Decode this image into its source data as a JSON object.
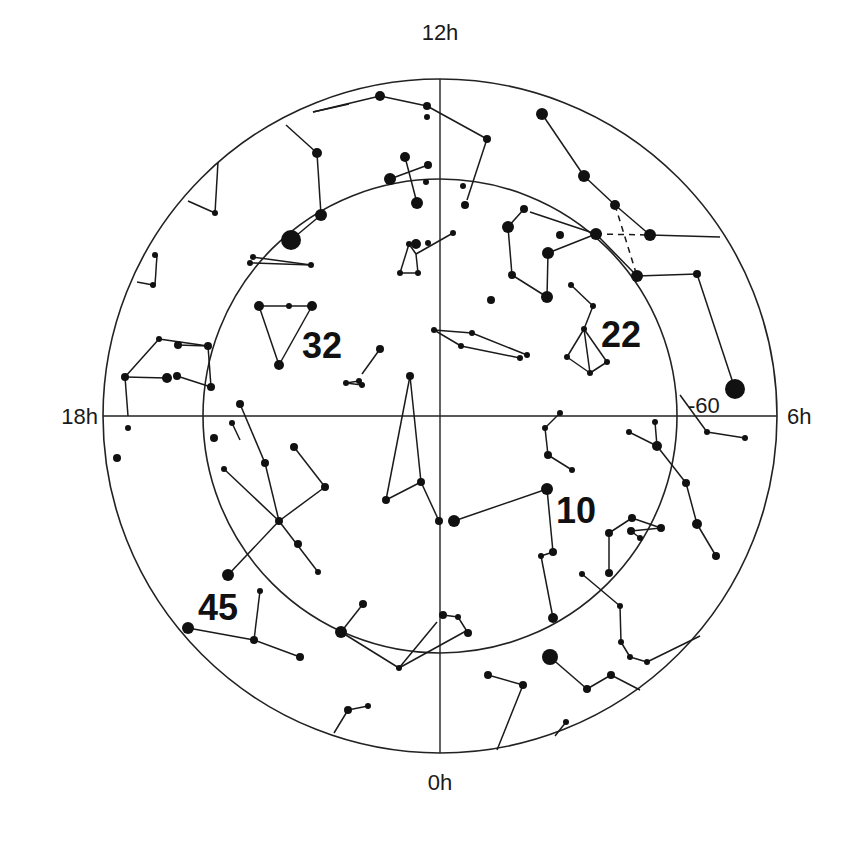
{
  "chart": {
    "title": "",
    "projection": "south polar sky chart",
    "center": [
      440,
      416
    ],
    "outer_radius": 337,
    "inner_radius": 237,
    "colors": {
      "ink": "#111111",
      "background": "#ffffff"
    }
  },
  "labels": {
    "hour_12": "12h",
    "hour_18": "18h",
    "hour_6": "6h",
    "hour_0": "0h",
    "declination": "-60",
    "field_32": "32",
    "field_22": "22",
    "field_10": "10",
    "field_45": "45"
  },
  "stars": [
    [
      380,
      96,
      5
    ],
    [
      427,
      106,
      4
    ],
    [
      427,
      117,
      3
    ],
    [
      487,
      139,
      4
    ],
    [
      317,
      153,
      5
    ],
    [
      405,
      157,
      5
    ],
    [
      428,
      165,
      4
    ],
    [
      390,
      179,
      6
    ],
    [
      426,
      182,
      3
    ],
    [
      417,
      203,
      6
    ],
    [
      463,
      186,
      3
    ],
    [
      465,
      205,
      4
    ],
    [
      321,
      215,
      6
    ],
    [
      291,
      240,
      10
    ],
    [
      215,
      213,
      3
    ],
    [
      155,
      255,
      3
    ],
    [
      153,
      285,
      3
    ],
    [
      253,
      257,
      3
    ],
    [
      250,
      263,
      3
    ],
    [
      311,
      265,
      3
    ],
    [
      259,
      306,
      5
    ],
    [
      289,
      306,
      3
    ],
    [
      312,
      306,
      5
    ],
    [
      279,
      365,
      5
    ],
    [
      416,
      244,
      5
    ],
    [
      409,
      244,
      3
    ],
    [
      428,
      243,
      3
    ],
    [
      453,
      233,
      3
    ],
    [
      400,
      273,
      3
    ],
    [
      418,
      273,
      3
    ],
    [
      542,
      114,
      6
    ],
    [
      584,
      176,
      6
    ],
    [
      615,
      205,
      5
    ],
    [
      596,
      234,
      6
    ],
    [
      650,
      235,
      6
    ],
    [
      637,
      276,
      6
    ],
    [
      697,
      274,
      4
    ],
    [
      735,
      389,
      10
    ],
    [
      524,
      209,
      4
    ],
    [
      508,
      227,
      6
    ],
    [
      512,
      275,
      4
    ],
    [
      547,
      297,
      6
    ],
    [
      548,
      253,
      6
    ],
    [
      560,
      235,
      4
    ],
    [
      491,
      300,
      4
    ],
    [
      571,
      285,
      3
    ],
    [
      593,
      306,
      3
    ],
    [
      584,
      329,
      3
    ],
    [
      567,
      357,
      3
    ],
    [
      590,
      373,
      3
    ],
    [
      607,
      362,
      3
    ],
    [
      434,
      330,
      3
    ],
    [
      472,
      333,
      3
    ],
    [
      461,
      346,
      3
    ],
    [
      520,
      358,
      3
    ],
    [
      527,
      355,
      3
    ],
    [
      178,
      345,
      4
    ],
    [
      208,
      346,
      4
    ],
    [
      159,
      339,
      3
    ],
    [
      125,
      377,
      4
    ],
    [
      167,
      378,
      5
    ],
    [
      177,
      376,
      4
    ],
    [
      211,
      387,
      4
    ],
    [
      380,
      349,
      4
    ],
    [
      359,
      381,
      3
    ],
    [
      346,
      383,
      3
    ],
    [
      362,
      385,
      3
    ],
    [
      410,
      376,
      4
    ],
    [
      421,
      482,
      4
    ],
    [
      386,
      500,
      4
    ],
    [
      439,
      521,
      4
    ],
    [
      454,
      521,
      6
    ],
    [
      547,
      489,
      6
    ],
    [
      128,
      428,
      3
    ],
    [
      117,
      458,
      4
    ],
    [
      240,
      404,
      4
    ],
    [
      232,
      423,
      3
    ],
    [
      214,
      438,
      4
    ],
    [
      224,
      469,
      3
    ],
    [
      265,
      463,
      4
    ],
    [
      294,
      447,
      4
    ],
    [
      325,
      487,
      4
    ],
    [
      279,
      521,
      4
    ],
    [
      298,
      544,
      4
    ],
    [
      318,
      572,
      3
    ],
    [
      228,
      575,
      6
    ],
    [
      260,
      591,
      3
    ],
    [
      254,
      640,
      4
    ],
    [
      300,
      657,
      4
    ],
    [
      188,
      628,
      6
    ],
    [
      560,
      413,
      3
    ],
    [
      545,
      428,
      3
    ],
    [
      548,
      455,
      4
    ],
    [
      572,
      470,
      3
    ],
    [
      553,
      552,
      4
    ],
    [
      541,
      556,
      3
    ],
    [
      553,
      618,
      5
    ],
    [
      629,
      432,
      3
    ],
    [
      655,
      422,
      3
    ],
    [
      657,
      446,
      5
    ],
    [
      686,
      483,
      4
    ],
    [
      697,
      524,
      5
    ],
    [
      716,
      556,
      4
    ],
    [
      707,
      432,
      3
    ],
    [
      745,
      438,
      3
    ],
    [
      609,
      533,
      4
    ],
    [
      632,
      518,
      4
    ],
    [
      631,
      531,
      4
    ],
    [
      640,
      538,
      3
    ],
    [
      661,
      528,
      4
    ],
    [
      609,
      573,
      4
    ],
    [
      582,
      574,
      3
    ],
    [
      620,
      606,
      3
    ],
    [
      621,
      642,
      3
    ],
    [
      630,
      657,
      3
    ],
    [
      647,
      662,
      3
    ],
    [
      363,
      604,
      4
    ],
    [
      341,
      632,
      6
    ],
    [
      399,
      668,
      3
    ],
    [
      443,
      615,
      4
    ],
    [
      458,
      617,
      3
    ],
    [
      468,
      633,
      4
    ],
    [
      550,
      657,
      8
    ],
    [
      488,
      675,
      4
    ],
    [
      523,
      685,
      4
    ],
    [
      587,
      689,
      4
    ],
    [
      611,
      675,
      4
    ],
    [
      566,
      722,
      3
    ],
    [
      348,
      710,
      4
    ],
    [
      368,
      706,
      3
    ]
  ],
  "lines": [
    [
      [
        380,
        96
      ],
      [
        427,
        106
      ]
    ],
    [
      [
        427,
        106
      ],
      [
        487,
        139
      ]
    ],
    [
      [
        487,
        139
      ],
      [
        467,
        200
      ]
    ],
    [
      [
        380,
        96
      ],
      [
        313,
        112
      ]
    ],
    [
      [
        313,
        112
      ],
      [
        349,
        104
      ]
    ],
    [
      [
        286,
        125
      ],
      [
        317,
        153
      ]
    ],
    [
      [
        317,
        153
      ],
      [
        321,
        215
      ]
    ],
    [
      [
        321,
        215
      ],
      [
        291,
        240
      ]
    ],
    [
      [
        390,
        179
      ],
      [
        428,
        165
      ]
    ],
    [
      [
        405,
        157
      ],
      [
        417,
        203
      ]
    ],
    [
      [
        218,
        162
      ],
      [
        215,
        213
      ]
    ],
    [
      [
        188,
        201
      ],
      [
        215,
        213
      ]
    ],
    [
      [
        157,
        255
      ],
      [
        155,
        285
      ]
    ],
    [
      [
        137,
        282
      ],
      [
        153,
        285
      ]
    ],
    [
      [
        253,
        263
      ],
      [
        311,
        265
      ]
    ],
    [
      [
        253,
        257
      ],
      [
        311,
        265
      ]
    ],
    [
      [
        259,
        306
      ],
      [
        312,
        306
      ]
    ],
    [
      [
        259,
        306
      ],
      [
        279,
        365
      ]
    ],
    [
      [
        312,
        306
      ],
      [
        279,
        365
      ]
    ],
    [
      [
        409,
        244
      ],
      [
        416,
        254
      ]
    ],
    [
      [
        416,
        254
      ],
      [
        453,
        233
      ]
    ],
    [
      [
        409,
        244
      ],
      [
        400,
        273
      ]
    ],
    [
      [
        416,
        254
      ],
      [
        418,
        273
      ]
    ],
    [
      [
        400,
        273
      ],
      [
        418,
        273
      ]
    ],
    [
      [
        542,
        114
      ],
      [
        584,
        176
      ]
    ],
    [
      [
        584,
        176
      ],
      [
        615,
        205
      ]
    ],
    [
      [
        615,
        205
      ],
      [
        650,
        235
      ]
    ],
    [
      [
        650,
        235
      ],
      [
        720,
        237
      ]
    ],
    [
      [
        615,
        205
      ],
      [
        637,
        276
      ]
    ],
    [
      [
        596,
        234
      ],
      [
        650,
        235
      ]
    ],
    [
      [
        524,
        209
      ],
      [
        508,
        227
      ]
    ],
    [
      [
        508,
        227
      ],
      [
        512,
        275
      ]
    ],
    [
      [
        512,
        275
      ],
      [
        547,
        297
      ]
    ],
    [
      [
        547,
        297
      ],
      [
        548,
        253
      ]
    ],
    [
      [
        548,
        253
      ],
      [
        596,
        234
      ]
    ],
    [
      [
        530,
        212
      ],
      [
        596,
        234
      ]
    ],
    [
      [
        596,
        234
      ],
      [
        637,
        276
      ]
    ],
    [
      [
        637,
        276
      ],
      [
        697,
        274
      ]
    ],
    [
      [
        697,
        274
      ],
      [
        735,
        389
      ]
    ],
    [
      [
        571,
        285
      ],
      [
        593,
        306
      ]
    ],
    [
      [
        593,
        306
      ],
      [
        584,
        329
      ]
    ],
    [
      [
        584,
        329
      ],
      [
        567,
        357
      ]
    ],
    [
      [
        584,
        329
      ],
      [
        590,
        373
      ]
    ],
    [
      [
        584,
        329
      ],
      [
        607,
        362
      ]
    ],
    [
      [
        567,
        357
      ],
      [
        590,
        373
      ]
    ],
    [
      [
        590,
        373
      ],
      [
        607,
        362
      ]
    ],
    [
      [
        434,
        330
      ],
      [
        472,
        333
      ]
    ],
    [
      [
        434,
        330
      ],
      [
        461,
        346
      ]
    ],
    [
      [
        472,
        333
      ],
      [
        527,
        355
      ]
    ],
    [
      [
        461,
        346
      ],
      [
        520,
        358
      ]
    ],
    [
      [
        125,
        377
      ],
      [
        159,
        339
      ]
    ],
    [
      [
        159,
        339
      ],
      [
        208,
        346
      ]
    ],
    [
      [
        208,
        346
      ],
      [
        178,
        345
      ]
    ],
    [
      [
        208,
        346
      ],
      [
        211,
        387
      ]
    ],
    [
      [
        125,
        377
      ],
      [
        167,
        378
      ]
    ],
    [
      [
        177,
        376
      ],
      [
        211,
        387
      ]
    ],
    [
      [
        125,
        377
      ],
      [
        128,
        416
      ]
    ],
    [
      [
        380,
        349
      ],
      [
        362,
        374
      ]
    ],
    [
      [
        346,
        383
      ],
      [
        362,
        385
      ]
    ],
    [
      [
        359,
        381
      ],
      [
        362,
        385
      ]
    ],
    [
      [
        346,
        383
      ],
      [
        359,
        381
      ]
    ],
    [
      [
        410,
        376
      ],
      [
        386,
        500
      ]
    ],
    [
      [
        410,
        376
      ],
      [
        421,
        482
      ]
    ],
    [
      [
        386,
        500
      ],
      [
        421,
        482
      ]
    ],
    [
      [
        421,
        482
      ],
      [
        439,
        521
      ]
    ],
    [
      [
        454,
        521
      ],
      [
        547,
        489
      ]
    ],
    [
      [
        547,
        489
      ],
      [
        553,
        552
      ]
    ],
    [
      [
        232,
        423
      ],
      [
        240,
        440
      ]
    ],
    [
      [
        240,
        404
      ],
      [
        265,
        463
      ]
    ],
    [
      [
        265,
        463
      ],
      [
        279,
        521
      ]
    ],
    [
      [
        224,
        469
      ],
      [
        279,
        521
      ]
    ],
    [
      [
        294,
        447
      ],
      [
        325,
        487
      ]
    ],
    [
      [
        325,
        487
      ],
      [
        279,
        521
      ]
    ],
    [
      [
        279,
        521
      ],
      [
        318,
        572
      ]
    ],
    [
      [
        279,
        521
      ],
      [
        228,
        575
      ]
    ],
    [
      [
        260,
        591
      ],
      [
        254,
        640
      ]
    ],
    [
      [
        188,
        628
      ],
      [
        254,
        640
      ]
    ],
    [
      [
        254,
        640
      ],
      [
        300,
        657
      ]
    ],
    [
      [
        560,
        413
      ],
      [
        545,
        428
      ]
    ],
    [
      [
        545,
        428
      ],
      [
        548,
        455
      ]
    ],
    [
      [
        548,
        455
      ],
      [
        572,
        470
      ]
    ],
    [
      [
        541,
        556
      ],
      [
        553,
        618
      ]
    ],
    [
      [
        553,
        552
      ],
      [
        541,
        556
      ]
    ],
    [
      [
        629,
        432
      ],
      [
        657,
        446
      ]
    ],
    [
      [
        655,
        422
      ],
      [
        657,
        446
      ]
    ],
    [
      [
        657,
        446
      ],
      [
        686,
        483
      ]
    ],
    [
      [
        686,
        483
      ],
      [
        697,
        524
      ]
    ],
    [
      [
        697,
        524
      ],
      [
        716,
        556
      ]
    ],
    [
      [
        680,
        395
      ],
      [
        707,
        432
      ]
    ],
    [
      [
        707,
        432
      ],
      [
        745,
        438
      ]
    ],
    [
      [
        609,
        533
      ],
      [
        632,
        518
      ]
    ],
    [
      [
        632,
        518
      ],
      [
        661,
        528
      ]
    ],
    [
      [
        609,
        533
      ],
      [
        609,
        573
      ]
    ],
    [
      [
        631,
        531
      ],
      [
        661,
        528
      ]
    ],
    [
      [
        640,
        538
      ],
      [
        631,
        531
      ]
    ],
    [
      [
        582,
        574
      ],
      [
        620,
        606
      ]
    ],
    [
      [
        620,
        606
      ],
      [
        621,
        642
      ]
    ],
    [
      [
        621,
        642
      ],
      [
        630,
        657
      ]
    ],
    [
      [
        630,
        657
      ],
      [
        647,
        662
      ]
    ],
    [
      [
        647,
        662
      ],
      [
        700,
        636
      ]
    ],
    [
      [
        363,
        604
      ],
      [
        341,
        632
      ]
    ],
    [
      [
        341,
        632
      ],
      [
        399,
        668
      ]
    ],
    [
      [
        399,
        668
      ],
      [
        437,
        622
      ]
    ],
    [
      [
        399,
        668
      ],
      [
        466,
        631
      ]
    ],
    [
      [
        443,
        615
      ],
      [
        458,
        617
      ]
    ],
    [
      [
        458,
        617
      ],
      [
        468,
        633
      ]
    ],
    [
      [
        550,
        657
      ],
      [
        587,
        689
      ]
    ],
    [
      [
        587,
        689
      ],
      [
        611,
        675
      ]
    ],
    [
      [
        611,
        675
      ],
      [
        640,
        690
      ]
    ],
    [
      [
        488,
        675
      ],
      [
        523,
        685
      ]
    ],
    [
      [
        523,
        685
      ],
      [
        497,
        750
      ]
    ],
    [
      [
        555,
        736
      ],
      [
        566,
        722
      ]
    ],
    [
      [
        334,
        733
      ],
      [
        348,
        710
      ]
    ],
    [
      [
        348,
        710
      ],
      [
        368,
        706
      ]
    ]
  ],
  "dashed_lines": [
    [
      [
        615,
        205
      ],
      [
        637,
        276
      ]
    ],
    [
      [
        596,
        234
      ],
      [
        650,
        235
      ]
    ]
  ]
}
